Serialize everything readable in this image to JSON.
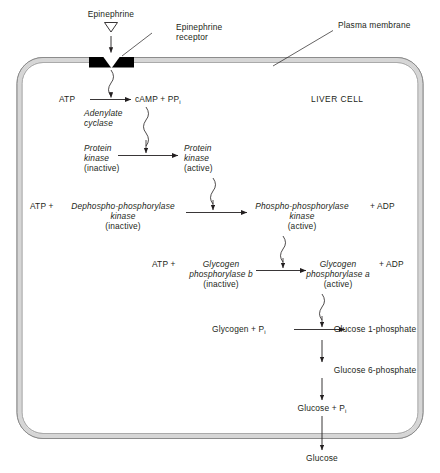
{
  "diagram": {
    "cell_label": "LIVER CELL",
    "colors": {
      "membrane_fill": "#d6d6d6",
      "membrane_stroke": "#8c8c8c",
      "receptor_fill": "#000000",
      "text": "#231f20",
      "arrow": "#231f20",
      "background": "#ffffff"
    }
  },
  "callouts": {
    "epinephrine": "Epinephrine",
    "epinephrine_receptor_line1": "Epinephrine",
    "epinephrine_receptor_line2": "receptor",
    "plasma_membrane": "Plasma membrane"
  },
  "steps": {
    "adenylate": {
      "substrate": "ATP",
      "enzyme_line1": "Adenylate",
      "enzyme_line2": "cyclase",
      "product": "cAMP + PP",
      "product_sub": "i"
    },
    "protein_kinase": {
      "left_line1": "Protein",
      "left_line2": "kinase",
      "left_line3": "(inactive)",
      "right_line1": "Protein",
      "right_line2": "kinase",
      "right_line3": "(active)"
    },
    "phosphorylase_kinase": {
      "atp": "ATP +",
      "left_line1": "Dephospho-phosphorylase",
      "left_line2": "kinase",
      "left_line3": "(inactive)",
      "right_line1": "Phospho-phosphorylase",
      "right_line2": "kinase",
      "right_line3": "(active)",
      "adp": "+ ADP"
    },
    "glycogen_phosphorylase": {
      "atp": "ATP +",
      "left_line1": "Glycogen",
      "left_line2": "phosphorylase b",
      "left_line3": "(inactive)",
      "right_line1": "Glycogen",
      "right_line2": "phosphorylase a",
      "right_line3": "(active)",
      "adp": "+ ADP"
    },
    "glycogenolysis": {
      "substrate": "Glycogen + P",
      "substrate_sub": "i",
      "product": "Glucose 1-phosphate",
      "g6p": "Glucose 6-phosphate",
      "glucose_pi": "Glucose + P",
      "glucose_pi_sub": "i",
      "glucose_out": "Glucose"
    }
  }
}
